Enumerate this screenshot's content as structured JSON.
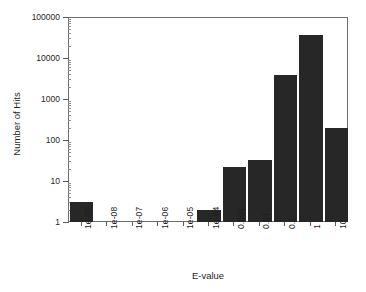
{
  "chart_data": {
    "type": "bar",
    "title": "",
    "xlabel": "E-value",
    "ylabel": "Number of Hits",
    "categories": [
      "1e-09",
      "1e-08",
      "1e-07",
      "1e-06",
      "1e-05",
      "1e-04",
      "0.001",
      "0.01",
      "0.1",
      "1",
      "10"
    ],
    "values": [
      3,
      0,
      0,
      0,
      0,
      2,
      22,
      33,
      3800,
      36000,
      200
    ],
    "yscale": "log",
    "ylim": [
      1,
      100000
    ],
    "y_tick_labels": [
      "100000",
      "10000",
      "1000",
      "100",
      "10",
      "1"
    ],
    "y_tick_values": [
      100000,
      10000,
      1000,
      100,
      10,
      1
    ],
    "grid": false,
    "legend": null,
    "bar_color": "#272727",
    "frame_color": "#6e6e6e",
    "x_tick_rotation": -90
  },
  "axes": {
    "x_title": "E-value",
    "y_title": "Number of Hits"
  }
}
